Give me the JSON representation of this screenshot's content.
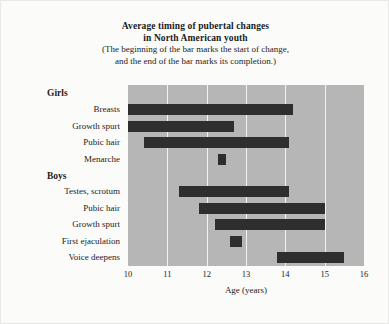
{
  "chart_data": {
    "type": "bar",
    "orientation": "horizontal-range",
    "title": "Average timing of pubertal changes in North American youth",
    "title_lines": [
      "Average timing of pubertal changes",
      "in North American youth"
    ],
    "subtitle_lines": [
      "(The beginning of the bar marks the start of change,",
      "and the end of the bar marks its completion.)"
    ],
    "xlabel": "Age (years)",
    "ylabel": "",
    "xlim": [
      10,
      16
    ],
    "xticks": [
      10,
      11,
      12,
      13,
      14,
      15,
      16
    ],
    "xtick_labels": [
      "10",
      "11",
      "12",
      "13",
      "14",
      "15",
      "16"
    ],
    "grid": true,
    "grid_axis": "x",
    "legend": false,
    "groups": [
      {
        "name": "Girls",
        "rows": [
          {
            "label": "Breasts",
            "start": 10.0,
            "end": 14.2
          },
          {
            "label": "Growth spurt",
            "start": 10.0,
            "end": 12.7
          },
          {
            "label": "Pubic hair",
            "start": 10.4,
            "end": 14.1
          },
          {
            "label": "Menarche",
            "start": 12.3,
            "end": 12.5
          }
        ]
      },
      {
        "name": "Boys",
        "rows": [
          {
            "label": "Testes, scrotum",
            "start": 11.3,
            "end": 14.1
          },
          {
            "label": "Pubic hair",
            "start": 11.8,
            "end": 15.0
          },
          {
            "label": "Growth spurt",
            "start": 12.2,
            "end": 15.0
          },
          {
            "label": "First ejaculation",
            "start": 12.6,
            "end": 12.9
          },
          {
            "label": "Voice deepens",
            "start": 13.8,
            "end": 15.5
          }
        ]
      }
    ],
    "colors": {
      "bar": "#2e2e2e",
      "plot_background": "#b6b6b6",
      "figure_background": "#fbfbfa",
      "gridline": "#f2f2f0",
      "text": "#1c1c1c"
    }
  }
}
